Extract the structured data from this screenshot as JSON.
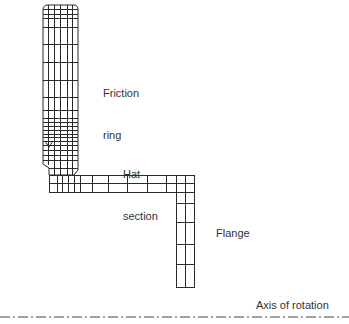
{
  "diagram": {
    "type": "finite-element-mesh-cross-section",
    "line_color": "#2a2a2a",
    "axis_color": "#444444",
    "labels": {
      "friction_ring": {
        "line1": "Friction",
        "line2": "ring"
      },
      "hat_section": {
        "line1": "Hat",
        "line2": "section"
      },
      "flange": "Flange",
      "axis": "Axis of rotation"
    },
    "parts": [
      {
        "name": "Friction ring",
        "orientation": "vertical"
      },
      {
        "name": "Hat section",
        "orientation": "horizontal"
      },
      {
        "name": "Flange",
        "orientation": "vertical"
      }
    ]
  }
}
